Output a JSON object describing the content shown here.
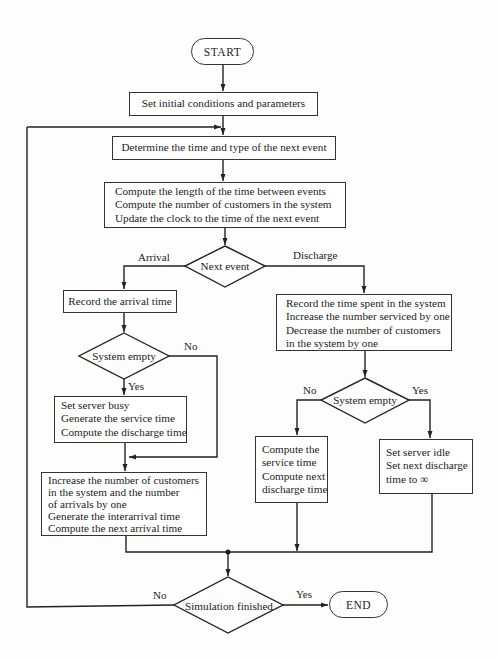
{
  "flowchart": {
    "start": "START",
    "end": "END",
    "init": "Set initial conditions and parameters",
    "determine": "Determine the time and type of the next event",
    "compute": [
      "Compute the length of the time between events",
      "Compute the number of customers in the system",
      "Update the clock to the time of the next event"
    ],
    "next_event": "Next event",
    "branch_arrival": "Arrival",
    "branch_discharge": "Discharge",
    "arrival": {
      "record": "Record the arrival time",
      "decision": "System empty",
      "no_label": "No",
      "yes_label": "Yes",
      "busy": [
        "Set server busy",
        "Generate the service time",
        "Compute the discharge time"
      ],
      "increase": [
        "Increase the number of customers",
        "in the system and the number",
        "of arrivals by one",
        "Generate the interarrival time",
        "Compute the next arrival time"
      ]
    },
    "discharge": {
      "record": [
        "Record the time spent in the system",
        "Increase the number serviced by one",
        "Decrease the number of customers",
        "in the system by one"
      ],
      "decision": "System empty",
      "no_label": "No",
      "yes_label": "Yes",
      "not_empty": [
        "Compute the",
        "service time",
        "Compute next",
        "discharge time"
      ],
      "empty": [
        "Set server idle",
        "Set next discharge",
        "time to ∞"
      ]
    },
    "finish": {
      "decision": "Simulation finished",
      "no_label": "No",
      "yes_label": "Yes"
    }
  }
}
